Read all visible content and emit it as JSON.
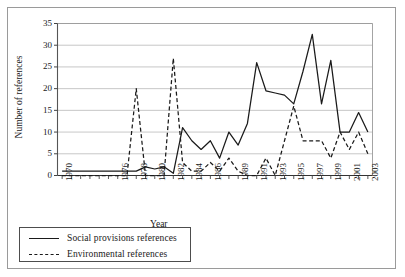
{
  "chart_data": {
    "type": "line",
    "title": "",
    "xlabel": "Year",
    "ylabel": "Number of references",
    "ylim": [
      0,
      35
    ],
    "ytick_step": 5,
    "yticks": [
      0,
      5,
      10,
      15,
      20,
      25,
      30,
      35
    ],
    "grid": true,
    "legend_position": "below-left",
    "x": [
      1970,
      1971,
      1972,
      1973,
      1974,
      1975,
      1976,
      1977,
      1978,
      1979,
      1980,
      1981,
      1982,
      1983,
      1984,
      1985,
      1986,
      1987,
      1988,
      1989,
      1990,
      1991,
      1992,
      1993,
      1994,
      1995,
      1996,
      1997,
      1998,
      1999,
      2000,
      2001,
      2002,
      2003
    ],
    "xtick_labels": [
      "1970",
      "",
      "",
      "",
      "",
      "",
      "1976",
      "",
      "1978",
      "",
      "1980",
      "",
      "1982",
      "",
      "1984",
      "",
      "1986",
      "",
      "",
      "1989",
      "",
      "1991",
      "",
      "1993",
      "",
      "1995",
      "",
      "1997",
      "",
      "1999",
      "",
      "2001",
      "",
      "2003"
    ],
    "series": [
      {
        "name": "Social provisions references",
        "style": "solid",
        "color": "#1a1a1a",
        "values": [
          1,
          1,
          1,
          1,
          1,
          1,
          1,
          1,
          1,
          2,
          2,
          1.5,
          2,
          0.5,
          11,
          8,
          6,
          8,
          7,
          4,
          10,
          7,
          12,
          26,
          19.5,
          19,
          18.5,
          16.5,
          24,
          32.5,
          16.5,
          26.5,
          22,
          10
        ]
      },
      {
        "name": "Environmental references",
        "style": "dashed",
        "color": "#1a1a1a",
        "values": [
          0,
          0,
          0,
          0,
          0,
          0,
          0,
          0,
          20,
          0,
          0,
          0,
          27,
          3,
          1,
          1,
          3,
          2,
          4,
          2,
          0,
          0,
          4,
          0,
          8,
          16,
          8,
          8,
          8,
          4,
          10,
          6,
          10,
          5
        ]
      }
    ],
    "series_solid_plot": [
      [
        1970,
        1
      ],
      [
        1971,
        1
      ],
      [
        1972,
        1
      ],
      [
        1973,
        1
      ],
      [
        1974,
        1
      ],
      [
        1975,
        1
      ],
      [
        1976,
        1
      ],
      [
        1977,
        1
      ],
      [
        1978,
        1
      ],
      [
        1979,
        2
      ],
      [
        1980,
        1.5
      ],
      [
        1981,
        2
      ],
      [
        1982,
        0.5
      ],
      [
        1983,
        11
      ],
      [
        1984,
        8
      ],
      [
        1985,
        6
      ],
      [
        1986,
        8
      ],
      [
        1987,
        4
      ],
      [
        1988,
        10
      ],
      [
        1989,
        7
      ],
      [
        1990,
        12
      ],
      [
        1991,
        26
      ],
      [
        1992,
        19.5
      ],
      [
        1993,
        19
      ],
      [
        1994,
        18.5
      ],
      [
        1995,
        16.5
      ],
      [
        1996,
        24
      ],
      [
        1997,
        32.5
      ],
      [
        1998,
        16.5
      ],
      [
        1999,
        26.5
      ],
      [
        2000,
        10
      ],
      [
        2001,
        10
      ],
      [
        2002,
        14.5
      ],
      [
        2003,
        10
      ]
    ],
    "series_dashed_plot": [
      [
        1970,
        0
      ],
      [
        1971,
        0
      ],
      [
        1972,
        0
      ],
      [
        1973,
        0
      ],
      [
        1974,
        0
      ],
      [
        1975,
        0
      ],
      [
        1976,
        0
      ],
      [
        1977,
        0
      ],
      [
        1978,
        20
      ],
      [
        1979,
        0
      ],
      [
        1980,
        0
      ],
      [
        1981,
        0
      ],
      [
        1982,
        27
      ],
      [
        1983,
        3
      ],
      [
        1984,
        1
      ],
      [
        1985,
        1
      ],
      [
        1986,
        3
      ],
      [
        1987,
        1
      ],
      [
        1988,
        4
      ],
      [
        1989,
        1
      ],
      [
        1990,
        0
      ],
      [
        1991,
        0
      ],
      [
        1992,
        4
      ],
      [
        1993,
        0
      ],
      [
        1994,
        8
      ],
      [
        1995,
        16
      ],
      [
        1996,
        8
      ],
      [
        1997,
        8
      ],
      [
        1998,
        8
      ],
      [
        1999,
        4
      ],
      [
        2000,
        10
      ],
      [
        2001,
        6
      ],
      [
        2002,
        10
      ],
      [
        2003,
        5
      ]
    ]
  },
  "legend": {
    "items": [
      {
        "label": "Social provisions references",
        "style": "solid"
      },
      {
        "label": "Environmental references",
        "style": "dashed"
      }
    ]
  },
  "axes": {
    "y_title": "Number of references",
    "x_title": "Year"
  }
}
